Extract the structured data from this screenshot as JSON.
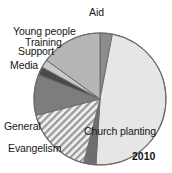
{
  "chart_data": {
    "type": "pie",
    "title": "",
    "subtitle": "",
    "year_label": "2010",
    "legend_position": "callout-labels",
    "grid": false,
    "categories": [
      "Aid",
      "Church planting",
      "Evangelism",
      "General",
      "Media",
      "Support",
      "Training",
      "Young people"
    ],
    "values": [
      3,
      48,
      3,
      17,
      10,
      2,
      2,
      15
    ],
    "units": "percent",
    "start_angle_deg": 0,
    "direction": "clockwise",
    "slices": [
      {
        "label": "Aid",
        "value": 3,
        "start_deg": 0,
        "end_deg": 10.8,
        "fill": "#8c8c8c",
        "pattern": "solid"
      },
      {
        "label": "Church planting",
        "value": 48,
        "start_deg": 10.8,
        "end_deg": 183.6,
        "fill": "#e6e6e4",
        "pattern": "solid"
      },
      {
        "label": "Evangelism",
        "value": 3,
        "start_deg": 183.6,
        "end_deg": 194.4,
        "fill": "#6e6e6e",
        "pattern": "solid"
      },
      {
        "label": "General",
        "value": 17,
        "start_deg": 194.4,
        "end_deg": 255.6,
        "fill": "#d8d8d6",
        "pattern": "diagonal-hatch"
      },
      {
        "label": "Media",
        "value": 10,
        "start_deg": 255.6,
        "end_deg": 291.6,
        "fill": "#7d7d7d",
        "pattern": "solid"
      },
      {
        "label": "Support",
        "value": 2,
        "start_deg": 291.6,
        "end_deg": 298.8,
        "fill": "#4a4a4a",
        "pattern": "solid"
      },
      {
        "label": "Training",
        "value": 2,
        "start_deg": 298.8,
        "end_deg": 306.0,
        "fill": "#c9c9c7",
        "pattern": "solid"
      },
      {
        "label": "Young people",
        "value": 15,
        "start_deg": 306.0,
        "end_deg": 360.0,
        "fill": "#b6b6b4",
        "pattern": "solid"
      }
    ],
    "geometry": {
      "cx": 100,
      "cy": 99,
      "r": 66
    },
    "colors": {
      "aid": "#8c8c8c",
      "church_planting": "#e6e6e4",
      "evangelism": "#6e6e6e",
      "general": "#d8d8d6",
      "media": "#7d7d7d",
      "support": "#4a4a4a",
      "training": "#c9c9c7",
      "young_people": "#b6b6b4",
      "outline": "#6b6b6b",
      "background": "#ffffff",
      "text": "#161616"
    }
  },
  "labels": {
    "aid": "Aid",
    "young_people": "Young people",
    "training": "Training",
    "support": "Support",
    "media": "Media",
    "general": "General",
    "evangelism": "Evangelism",
    "church_planting": "Church planting",
    "year": "2010"
  }
}
